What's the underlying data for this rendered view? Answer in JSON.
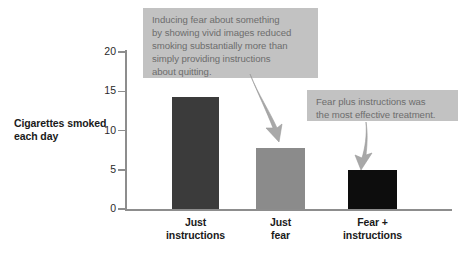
{
  "chart_data": {
    "type": "bar",
    "title": "",
    "xlabel": "",
    "ylabel": "Cigarettes smoked each day",
    "categories": [
      "Just instructions",
      "Just fear",
      "Fear + instructions"
    ],
    "category_lines": [
      [
        "Just",
        "instructions"
      ],
      [
        "Just",
        "fear"
      ],
      [
        "Fear +",
        "instructions"
      ]
    ],
    "values": [
      14.3,
      7.8,
      5.0
    ],
    "bar_colors": [
      "#3b3b3b",
      "#8b8b8b",
      "#0d0d0d"
    ],
    "ylim": [
      0,
      20
    ],
    "yticks": [
      0,
      5,
      10,
      15,
      20
    ],
    "ytick_labels": [
      "0",
      "5",
      "10",
      "15",
      "20"
    ],
    "grid": false,
    "legend": false,
    "annotations": [
      {
        "text": "Inducing fear about something by showing vivid images reduced smoking substantially more than simply providing instructions about quitting.",
        "lines": [
          "Inducing fear about something",
          "by showing vivid images reduced",
          "smoking substantially more than",
          "simply providing instructions",
          "about quitting."
        ],
        "points_to": "Just fear"
      },
      {
        "text": "Fear plus instructions was the most effective treatment.",
        "lines": [
          "Fear plus instructions was",
          "the most effective treatment."
        ],
        "points_to": "Fear + instructions"
      }
    ]
  },
  "axis": {
    "y_title_lines": [
      "Cigarettes smoked",
      "each day"
    ]
  },
  "colors": {
    "axis": "#8d8d8d",
    "callout_bg": "#c2c2c2",
    "callout_text": "#6d6d6d",
    "arrow": "#a8a8a8",
    "background": "#ffffff"
  }
}
